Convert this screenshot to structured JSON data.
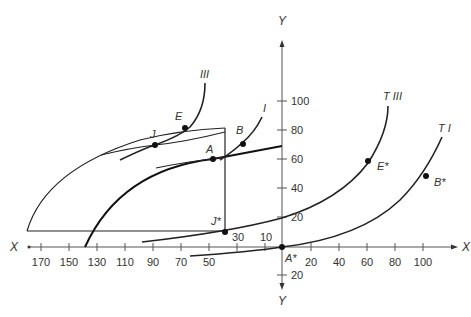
{
  "diagram": {
    "type": "trade-offer-curve-diagram",
    "axes": {
      "x_label_left": "X",
      "x_label_right": "X",
      "y_label_top": "Y",
      "y_label_bottom": "Y",
      "x_ticks_left": [
        "170",
        "150",
        "130",
        "110",
        "90",
        "70",
        "50",
        "30",
        "10"
      ],
      "x_ticks_right": [
        "20",
        "40",
        "60",
        "80",
        "100"
      ],
      "y_ticks_up": [
        "100",
        "80",
        "60",
        "40",
        "20"
      ],
      "y_ticks_down": [
        "20"
      ]
    },
    "curves": {
      "indifference_III": "III",
      "indifference_I": "I",
      "trade_indifference_III": "T III",
      "trade_indifference_I": "T I"
    },
    "points": {
      "J": "J",
      "E": "E",
      "A": "A",
      "B": "B",
      "J_star": "J*",
      "E_star": "E*",
      "B_star": "B*",
      "A_star": "A*"
    }
  }
}
